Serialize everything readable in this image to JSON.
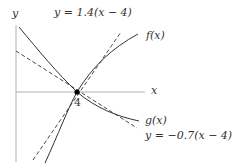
{
  "diagram": {
    "axes": {
      "x_label": "x",
      "y_label": "y",
      "tick_label": "4",
      "axis_color": "#9a9a9a"
    },
    "point": {
      "x_value": 4,
      "y_value": 0,
      "color": "#000000"
    },
    "curves": [
      {
        "name": "f",
        "label": "f(x)",
        "style": "solid",
        "color": "#333333"
      },
      {
        "name": "g",
        "label": "g(x)",
        "style": "solid",
        "color": "#333333"
      }
    ],
    "tangents": [
      {
        "label": "y = 1.4(x − 4)",
        "slope": 1.4,
        "style": "dashed",
        "color": "#333333"
      },
      {
        "label": "y = −0.7(x − 4)",
        "slope": -0.7,
        "style": "dashed",
        "color": "#333333"
      }
    ]
  }
}
